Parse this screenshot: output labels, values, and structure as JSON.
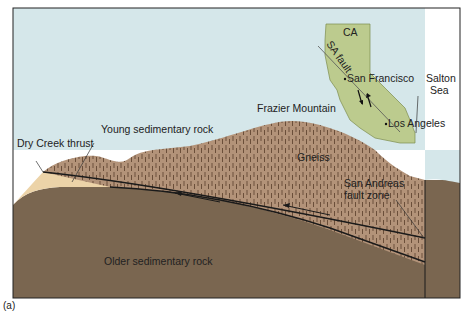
{
  "figure": {
    "caption_label": "(a)",
    "labels": {
      "dry_creek_thrust": "Dry Creek thrust",
      "young_sedimentary_rock": "Young sedimentary rock",
      "frazier_mountain": "Frazier Mountain",
      "gneiss": "Gneiss",
      "san_andreas_line1": "San Andreas",
      "san_andreas_line2": "fault  zone",
      "older_sedimentary_rock": "Older sedimentary rock"
    },
    "inset_map": {
      "state": "CA",
      "fault": "SA fault",
      "cities": [
        "San Francisco",
        "Los Angeles"
      ],
      "salton_line1": "Salton",
      "salton_line2": "Sea"
    },
    "colors": {
      "sky": "#d5e7ea",
      "gneiss": "#b39379",
      "older_rock": "#7a6650",
      "young_rock": "#ecd3a8",
      "map_fill": "#bccb8e",
      "outline": "#222222"
    }
  }
}
